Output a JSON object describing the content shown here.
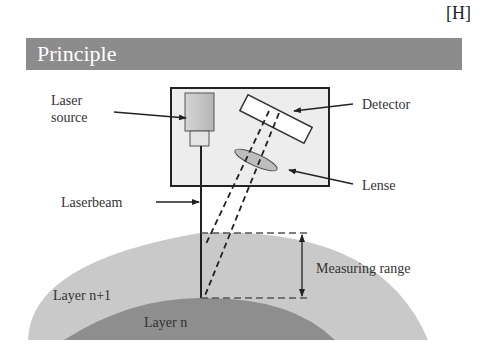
{
  "header": {
    "tag": "[H]",
    "title": "Principle"
  },
  "labels": {
    "laser_source": [
      "Laser",
      "source"
    ],
    "detector": "Detector",
    "lense": "Lense",
    "laserbeam": "Laserbeam",
    "measuring_range": "Measuring range",
    "layer_n_plus_1": "Layer n+1",
    "layer_n": "Layer n"
  },
  "colors": {
    "title_bar": "#8c8c8c",
    "device_box_fill": "#ededed",
    "layer_n_plus_1": "#c9c9c9",
    "layer_n": "#8e8e8e",
    "lines": "#222222"
  }
}
